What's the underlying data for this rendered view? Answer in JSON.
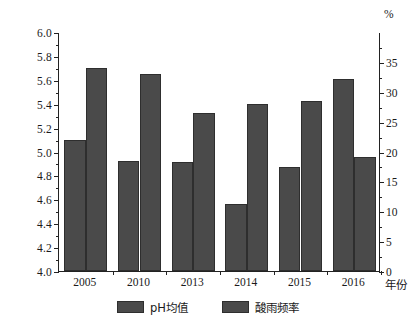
{
  "chart_data": {
    "type": "bar",
    "title": "",
    "subtitle": "",
    "categories": [
      "2005",
      "2010",
      "2013",
      "2014",
      "2015",
      "2016"
    ],
    "series": [
      {
        "name": "pH均值",
        "axis": "left",
        "values": [
          5.1,
          4.92,
          4.91,
          4.56,
          4.87,
          5.61
        ],
        "color": "#4a4a4a"
      },
      {
        "name": "酸雨频率",
        "axis": "right",
        "values": [
          34.0,
          33.0,
          26.5,
          28.0,
          28.5,
          19.0
        ],
        "color": "#4a4a4a"
      }
    ],
    "xlabel": "年份",
    "ylabel_left": "",
    "ylabel_right": "%",
    "ylim_left": [
      4.0,
      6.0
    ],
    "ylim_right": [
      0,
      40
    ],
    "ytick_left": [
      "4.0",
      "4.2",
      "4.4",
      "4.6",
      "4.8",
      "5.0",
      "5.2",
      "5.4",
      "5.6",
      "5.8",
      "6.0"
    ],
    "ytick_left_values": [
      4.0,
      4.2,
      4.4,
      4.6,
      4.8,
      5.0,
      5.2,
      5.4,
      5.6,
      5.8,
      6.0
    ],
    "ytick_right": [
      "0",
      "5",
      "10",
      "15",
      "20",
      "25",
      "30",
      "35"
    ],
    "ytick_right_values": [
      0,
      5,
      10,
      15,
      20,
      25,
      30,
      35
    ],
    "grid": false,
    "legend_position": "bottom",
    "legend": [
      "pH均值",
      "酸雨频率"
    ]
  },
  "axes": {
    "left_unit": "",
    "right_unit": "%",
    "x_title": "年份"
  }
}
